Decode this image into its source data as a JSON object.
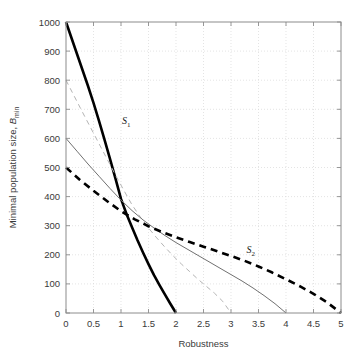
{
  "chart_data": {
    "type": "line",
    "title": "",
    "xlabel": "Robustness",
    "ylabel": "Minimal population size, B_min",
    "ylabel_main": "Minimal population size, ",
    "ylabel_var": "B",
    "ylabel_sub": "min",
    "xlim": [
      0,
      5
    ],
    "ylim": [
      0,
      1000
    ],
    "xticks": [
      0,
      0.5,
      1,
      1.5,
      2,
      2.5,
      3,
      3.5,
      4,
      4.5,
      5
    ],
    "xticklabels": [
      "0",
      "0.5",
      "1",
      "1.5",
      "2",
      "2.5",
      "3",
      "3.5",
      "4",
      "4.5",
      "5"
    ],
    "yticks": [
      0,
      100,
      200,
      300,
      400,
      500,
      600,
      700,
      800,
      900,
      1000
    ],
    "yticklabels": [
      "0",
      "100",
      "200",
      "300",
      "400",
      "500",
      "600",
      "700",
      "800",
      "900",
      "1000"
    ],
    "grid": true,
    "grid_style": "dotted",
    "grid_color": "#d8d8d8",
    "axis_color": "#9a9a9a",
    "legend": "none",
    "annotations": [
      {
        "text": "S",
        "sub": "1",
        "x": 1.02,
        "y": 648,
        "name": "curve-label-s1"
      },
      {
        "text": "S",
        "sub": "2",
        "x": 3.28,
        "y": 205,
        "name": "curve-label-s2"
      }
    ],
    "series": [
      {
        "name": "S1",
        "style": "thick-solid-black",
        "color": "#000000",
        "width": 2.6,
        "dash": "none",
        "x": [
          0,
          0.1,
          0.2,
          0.3,
          0.4,
          0.5,
          0.6,
          0.7,
          0.8,
          0.9,
          1.0,
          1.1,
          1.2,
          1.3,
          1.4,
          1.5,
          1.6,
          1.7,
          1.8,
          1.9,
          2.0
        ],
        "y": [
          1000,
          945,
          890,
          835,
          780,
          722,
          660,
          596,
          530,
          462,
          392,
          340,
          295,
          250,
          208,
          168,
          130,
          96,
          63,
          31,
          0
        ]
      },
      {
        "name": "gray-dashed",
        "style": "thin-dashed-gray",
        "color": "#b4b4b4",
        "width": 1.0,
        "dash": "5,4",
        "x": [
          0,
          0.15,
          0.3,
          0.45,
          0.6,
          0.75,
          0.9,
          1.05,
          1.2,
          1.35,
          1.5,
          1.65,
          1.8,
          1.95,
          2.1,
          2.25,
          2.4,
          2.55,
          2.7,
          2.85,
          3.0
        ],
        "y": [
          800,
          745,
          690,
          636,
          582,
          528,
          474,
          422,
          372,
          330,
          292,
          258,
          226,
          196,
          168,
          142,
          116,
          92,
          68,
          40,
          0
        ]
      },
      {
        "name": "thin-gray-solid",
        "style": "thin-solid-gray",
        "color": "#707070",
        "width": 1.0,
        "dash": "none",
        "x": [
          0,
          0.2,
          0.4,
          0.6,
          0.8,
          1.0,
          1.2,
          1.4,
          1.6,
          1.8,
          2.0,
          2.2,
          2.4,
          2.6,
          2.8,
          3.0,
          3.2,
          3.4,
          3.6,
          3.8,
          4.0
        ],
        "y": [
          600,
          556,
          512,
          470,
          428,
          388,
          352,
          320,
          292,
          266,
          242,
          220,
          198,
          176,
          154,
          132,
          110,
          86,
          60,
          32,
          0
        ]
      },
      {
        "name": "S2",
        "style": "thick-dashed-black",
        "color": "#000000",
        "width": 2.6,
        "dash": "7,5",
        "x": [
          0,
          0.25,
          0.5,
          0.75,
          1.0,
          1.25,
          1.5,
          1.75,
          2.0,
          2.25,
          2.5,
          2.75,
          3.0,
          3.25,
          3.5,
          3.75,
          4.0,
          4.25,
          4.5,
          4.75,
          5.0
        ],
        "y": [
          500,
          458,
          420,
          384,
          350,
          322,
          298,
          278,
          260,
          244,
          228,
          212,
          196,
          179,
          160,
          139,
          116,
          92,
          66,
          36,
          0
        ]
      }
    ]
  },
  "figure": {
    "background": "#ffffff",
    "plot_left": 66,
    "plot_top": 22,
    "plot_right": 341,
    "plot_bottom": 313
  }
}
